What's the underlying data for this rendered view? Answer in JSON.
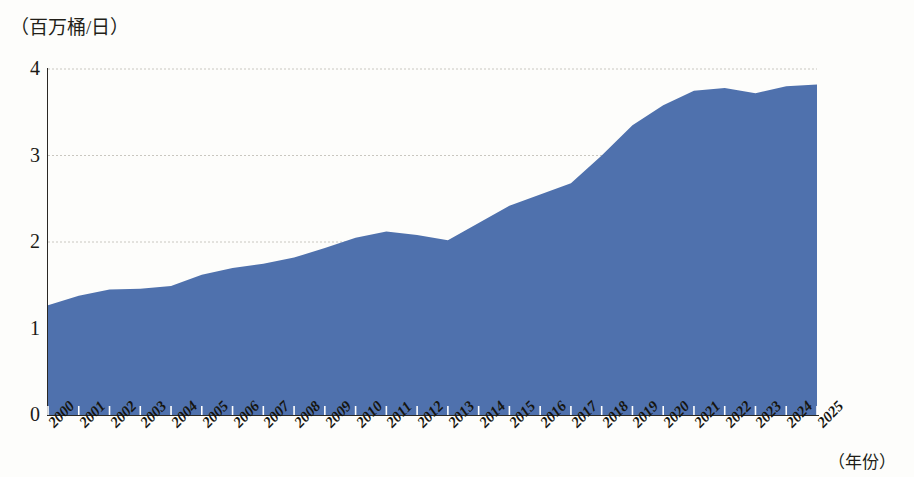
{
  "chart_data": {
    "type": "area",
    "title": "",
    "subtitle": "",
    "ylabel": "（百万桶/日）",
    "xlabel": "（年份）",
    "ylim": [
      0,
      4
    ],
    "xlim": [
      "2000",
      "2025"
    ],
    "grid": true,
    "legend_position": "none",
    "series_color": "#4f71ad",
    "categories": [
      "2000",
      "2001",
      "2002",
      "2003",
      "2004",
      "2005",
      "2006",
      "2007",
      "2008",
      "2009",
      "2010",
      "2011",
      "2012",
      "2013",
      "2014",
      "2015",
      "2016",
      "2017",
      "2018",
      "2019",
      "2020",
      "2021",
      "2022",
      "2023",
      "2024",
      "2025"
    ],
    "values": [
      1.27,
      1.38,
      1.45,
      1.46,
      1.49,
      1.62,
      1.7,
      1.75,
      1.82,
      1.93,
      2.05,
      2.12,
      2.08,
      2.02,
      2.22,
      2.42,
      2.55,
      2.68,
      3.0,
      3.35,
      3.58,
      3.75,
      3.78,
      3.72,
      3.8,
      3.82
    ],
    "y_ticks": [
      "0",
      "1",
      "2",
      "3",
      "4"
    ],
    "y_tick_values": [
      0,
      1,
      2,
      3,
      4
    ]
  },
  "colors": {
    "area_fill": "#4f71ad",
    "gridline": "#c9c7c0",
    "axis": "#2a2824",
    "text": "#1b1a16",
    "background": "#fdfdfb"
  }
}
